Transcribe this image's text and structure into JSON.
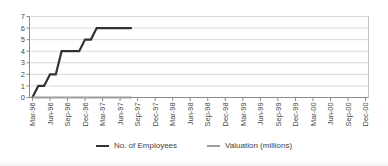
{
  "chart_data": {
    "type": "line",
    "title": "",
    "x_axis": {
      "total_months": 58,
      "tick_every_months": 3,
      "tick_labels": [
        "Mar-96",
        "Jun-96",
        "Sep-96",
        "Dec-96",
        "Mar-97",
        "Jun-97",
        "Sep-97",
        "Dec-97",
        "Mar-98",
        "Jun-98",
        "Sep-98",
        "Dec-98",
        "Mar-99",
        "Jun-99",
        "Sep-99",
        "Dec-99",
        "Mar-00",
        "Jun-00",
        "Sep-00",
        "Dec-00"
      ]
    },
    "y_axis": {
      "min": 0,
      "max": 7,
      "step": 1,
      "tick_labels": [
        "0",
        "1",
        "2",
        "3",
        "4",
        "5",
        "6",
        "7"
      ]
    },
    "grid": true,
    "legend_position": "bottom",
    "series": [
      {
        "name": "No. of Employees",
        "color": "#323232",
        "stroke_width": 2.2,
        "months": [
          "Mar-96",
          "Apr-96",
          "May-96",
          "Jun-96",
          "Jul-96",
          "Aug-96",
          "Sep-96",
          "Oct-96",
          "Nov-96",
          "Dec-96",
          "Jan-97",
          "Feb-97",
          "Mar-97",
          "Apr-97",
          "May-97",
          "Jun-97",
          "Jul-97",
          "Aug-97"
        ],
        "values": [
          0,
          1,
          1,
          2,
          2,
          4,
          4,
          4,
          4,
          5,
          5,
          6,
          6,
          6,
          6,
          6,
          6,
          6
        ]
      },
      {
        "name": "Valuation (millions)",
        "color": "#9c9c9c",
        "stroke_width": 2,
        "months": [
          "Mar-96",
          "Apr-96",
          "May-96",
          "Jun-96",
          "Jul-96",
          "Aug-96",
          "Sep-96",
          "Oct-96",
          "Nov-96",
          "Dec-96",
          "Jan-97",
          "Feb-97",
          "Mar-97",
          "Apr-97",
          "May-97",
          "Jun-97",
          "Jul-97",
          "Aug-97"
        ],
        "values": [
          0,
          0,
          0,
          0,
          0,
          0,
          0,
          0,
          0,
          0,
          0,
          0,
          0,
          0,
          0,
          0,
          0,
          0
        ]
      }
    ]
  },
  "styles": {
    "gridline_color": "#d9d9d9",
    "plot_border_color": "#c2c2c2",
    "axis_color": "#8a8a8a",
    "text_color": "#474747",
    "background": "#ffffff"
  }
}
